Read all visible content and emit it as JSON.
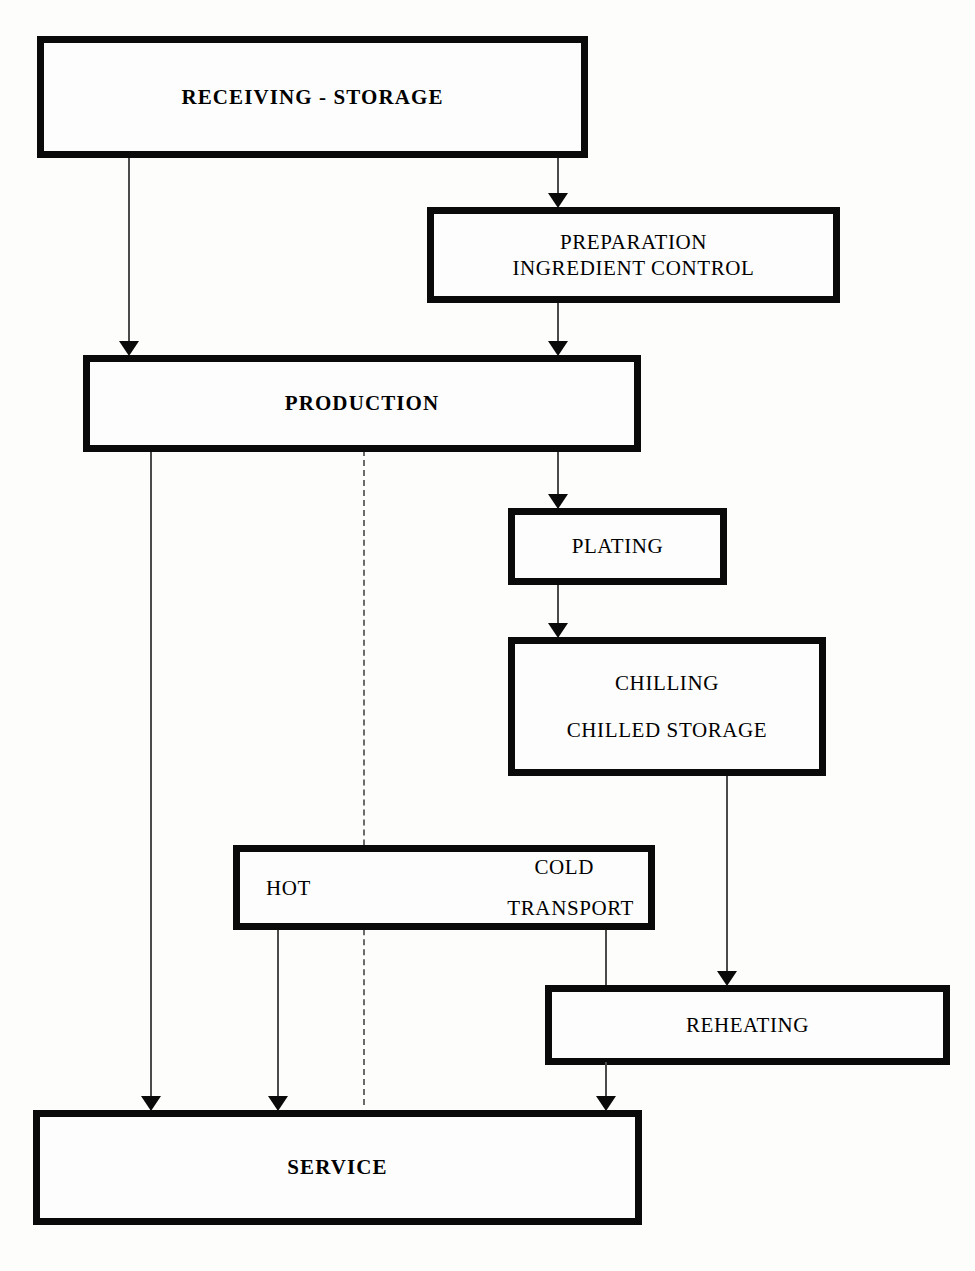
{
  "diagram": {
    "nodes": {
      "receiving": {
        "label": "RECEIVING - STORAGE"
      },
      "preparation": {
        "line1": "PREPARATION",
        "line2": "INGREDIENT CONTROL"
      },
      "production": {
        "label": "PRODUCTION"
      },
      "plating": {
        "label": "PLATING"
      },
      "chilling": {
        "line1": "CHILLING",
        "line2": "CHILLED STORAGE"
      },
      "transport": {
        "hot": "HOT",
        "cold": "COLD",
        "transport": "TRANSPORT"
      },
      "reheating": {
        "label": "REHEATING"
      },
      "service": {
        "label": "SERVICE"
      }
    },
    "colors": {
      "box_border": "#0a0a0a",
      "box_fill": "#fdfdfd",
      "connector": "#4a4a4a",
      "dashed_connector": "#6b6b6b",
      "background": "#fdfdfb",
      "text": "#000000"
    },
    "edges": [
      {
        "from": "receiving",
        "to": "production",
        "style": "solid",
        "arrow": true
      },
      {
        "from": "receiving",
        "to": "preparation",
        "style": "solid",
        "arrow": true
      },
      {
        "from": "preparation",
        "to": "production",
        "style": "solid",
        "arrow": true
      },
      {
        "from": "production",
        "to": "plating",
        "style": "solid",
        "arrow": true
      },
      {
        "from": "plating",
        "to": "chilling",
        "style": "solid",
        "arrow": true
      },
      {
        "from": "chilling",
        "to": "reheating",
        "style": "solid",
        "arrow": true
      },
      {
        "from": "production",
        "to": "service",
        "style": "solid",
        "arrow": true
      },
      {
        "from": "production",
        "to": "service",
        "style": "dashed",
        "arrow": false
      },
      {
        "from": "transport",
        "to": "service",
        "style": "solid",
        "arrow": true
      },
      {
        "from": "transport",
        "to": "service",
        "style": "solid",
        "arrow": true
      },
      {
        "from": "reheating",
        "to": "service",
        "style": "solid",
        "arrow": true
      }
    ]
  }
}
